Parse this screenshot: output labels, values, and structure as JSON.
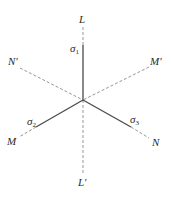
{
  "diagram": {
    "title": "",
    "center": {
      "x": 83,
      "y": 100
    },
    "colors": {
      "solid": "#4a4a4a",
      "dashed": "#8a8a8a",
      "text": "#2a2a2a",
      "background": "#ffffff"
    },
    "axes": [
      {
        "id": "L",
        "label": "L",
        "end": {
          "x": 83,
          "y": 27
        },
        "solid_to": {
          "x": 83,
          "y": 45
        }
      },
      {
        "id": "L-prime",
        "label": "L′",
        "end": {
          "x": 83,
          "y": 173
        }
      },
      {
        "id": "N-prime",
        "label": "N′",
        "end": {
          "x": 20,
          "y": 68
        }
      },
      {
        "id": "M-prime",
        "label": "M′",
        "end": {
          "x": 149,
          "y": 67
        }
      },
      {
        "id": "M",
        "label": "M",
        "end": {
          "x": 19,
          "y": 137
        },
        "solid_to": {
          "x": 36,
          "y": 127
        }
      },
      {
        "id": "N",
        "label": "N",
        "end": {
          "x": 149,
          "y": 138
        },
        "solid_to": {
          "x": 131,
          "y": 127
        }
      }
    ],
    "stress_labels": [
      {
        "id": "sigma1",
        "symbol": "σ",
        "subscript": "1",
        "axis": "L"
      },
      {
        "id": "sigma2",
        "symbol": "σ",
        "subscript": "2",
        "axis": "M"
      },
      {
        "id": "sigma3",
        "symbol": "σ",
        "subscript": "3",
        "axis": "N"
      }
    ]
  }
}
